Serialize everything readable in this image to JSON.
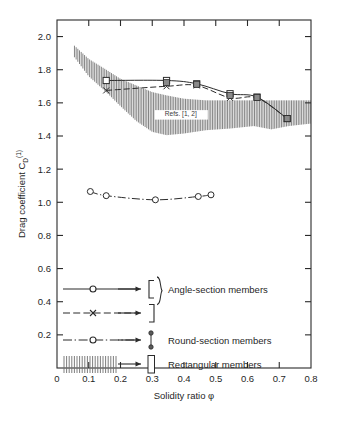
{
  "figure": {
    "background_color": "#ffffff",
    "line_color": "#2b2b2b",
    "hatch_color": "#6f6f6f",
    "marker_fill": "#8a8a8a",
    "width": 337,
    "height": 421
  },
  "chart_data": {
    "type": "line",
    "title": "",
    "xlabel": "Solidity ratio φ",
    "ylabel": "Drag coefficient C",
    "ylabel_sub": "D",
    "ylabel_sup": "(1)",
    "xlim": [
      0,
      0.8
    ],
    "ylim": [
      0.0,
      2.1
    ],
    "grid": false,
    "legend_position": "inside-lower-left",
    "xticks": [
      0,
      0.1,
      0.2,
      0.3,
      0.4,
      0.5,
      0.6,
      0.7,
      0.8
    ],
    "xtick_labels": [
      "0",
      "0.1",
      "0.2",
      "0.3",
      "0.4",
      "0.5",
      "0.6",
      "0.7",
      "0.8"
    ],
    "yticks": [
      0.2,
      0.4,
      0.6,
      0.8,
      1.0,
      1.2,
      1.4,
      1.6,
      1.8,
      2.0
    ],
    "ytick_labels": [
      "0.2",
      "0.4",
      "0.6",
      "0.8",
      "1.0",
      "1.2",
      "1.4",
      "1.6",
      "1.8",
      "2.0"
    ],
    "annotations": [
      {
        "text": "Refs. [1, 2]",
        "x": 0.39,
        "y": 1.52
      }
    ],
    "series": [
      {
        "name": "Angle-section members (solid, open square markers)",
        "style": "solid",
        "marker": "square-open",
        "x": [
          0.155,
          0.345,
          0.44,
          0.545,
          0.63,
          0.725
        ],
        "y": [
          1.735,
          1.735,
          1.715,
          1.655,
          1.635,
          1.505
        ]
      },
      {
        "name": "Angle-section members (dashed, cross markers)",
        "style": "dashed",
        "marker": "cross",
        "x": [
          0.155,
          0.345,
          0.44,
          0.545,
          0.63,
          0.725
        ],
        "y": [
          1.675,
          1.7,
          1.705,
          1.63,
          1.63,
          1.505
        ]
      },
      {
        "name": "Round-section members (dash-dot, open circle markers)",
        "style": "dash-dot",
        "marker": "circle-open",
        "x": [
          0.105,
          0.155,
          0.31,
          0.445,
          0.485
        ],
        "y": [
          1.065,
          1.04,
          1.015,
          1.035,
          1.045
        ]
      }
    ],
    "bands": [
      {
        "name": "Rectangular members (vertical hatch band)",
        "style": "vertical-hatch",
        "x": [
          0.055,
          0.1,
          0.155,
          0.2,
          0.25,
          0.3,
          0.345,
          0.4,
          0.47,
          0.545,
          0.62,
          0.675,
          0.73,
          0.8
        ],
        "y_top": [
          1.945,
          1.865,
          1.8,
          1.745,
          1.705,
          1.665,
          1.645,
          1.625,
          1.615,
          1.615,
          1.615,
          1.615,
          1.615,
          1.615
        ],
        "y_bot": [
          1.875,
          1.76,
          1.665,
          1.58,
          1.49,
          1.425,
          1.405,
          1.415,
          1.435,
          1.445,
          1.46,
          1.44,
          1.46,
          1.475
        ]
      }
    ]
  },
  "legend": {
    "entries": [
      {
        "id": "angle-solid",
        "symbol": "solid-line-open-circle",
        "bracket": "left-bracket",
        "label": "Angle-section members",
        "label_shared": true
      },
      {
        "id": "angle-dashed",
        "symbol": "dashed-line-cross",
        "bracket": "right-bracket",
        "label": "",
        "label_shared": true
      },
      {
        "id": "round",
        "symbol": "dashdot-line-open-circle",
        "bracket": "round-section-glyph",
        "label": "Round-section members"
      },
      {
        "id": "rectangular",
        "symbol": "vertical-hatch-swatch",
        "bracket": "rectangle-glyph",
        "label": "Rectangular members"
      }
    ],
    "arrow_icon": "arrow-right-icon",
    "brace_icon": "curly-brace-icon"
  }
}
